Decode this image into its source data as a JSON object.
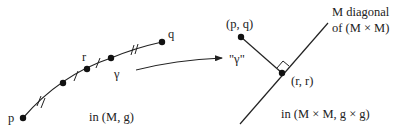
{
  "colors": {
    "ink": "#222222",
    "background": "#ffffff"
  },
  "left_panel": {
    "point_p_label": "p",
    "point_q_label": "q",
    "point_r_label": "r",
    "curve_label": "γ",
    "space_label": "in (M, g)"
  },
  "arrow": {
    "target_label": "\"γ\""
  },
  "right_panel": {
    "point_pq_label": "(p, q)",
    "point_rr_label": "(r, r)",
    "diagonal_label_line1": "M diagonal",
    "diagonal_label_line2": "of (M × M)",
    "space_label": "in (M × M, g × g)"
  }
}
